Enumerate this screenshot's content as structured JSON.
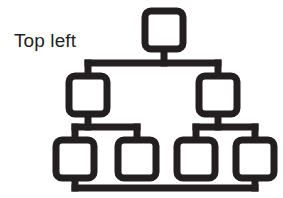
{
  "canvas": {
    "width": 283,
    "height": 198,
    "background_color": "#ffffff"
  },
  "label": {
    "text": "Top left",
    "color": "#231f20",
    "x": 14,
    "y": 30,
    "font_size": 19
  },
  "diagram": {
    "name": "hierarchy-tree-icon",
    "stroke_color": "#231f20",
    "fill_color": "#ffffff",
    "stroke_width": 7,
    "corner_radius": 6,
    "nodes": [
      {
        "id": "root",
        "level": 0,
        "x": 145,
        "y": 11,
        "w": 38,
        "h": 38,
        "label": ""
      },
      {
        "id": "mid-1",
        "level": 1,
        "x": 69,
        "y": 76,
        "w": 38,
        "h": 38,
        "label": ""
      },
      {
        "id": "mid-2",
        "level": 1,
        "x": 199,
        "y": 76,
        "w": 38,
        "h": 38,
        "label": ""
      },
      {
        "id": "leaf-1",
        "level": 2,
        "x": 56,
        "y": 140,
        "w": 38,
        "h": 38,
        "label": ""
      },
      {
        "id": "leaf-2",
        "level": 2,
        "x": 118,
        "y": 140,
        "w": 38,
        "h": 38,
        "label": ""
      },
      {
        "id": "leaf-3",
        "level": 2,
        "x": 177,
        "y": 140,
        "w": 38,
        "h": 38,
        "label": ""
      },
      {
        "id": "leaf-4",
        "level": 2,
        "x": 236,
        "y": 140,
        "w": 38,
        "h": 38,
        "label": ""
      }
    ],
    "connectors": [
      {
        "id": "root-stem",
        "type": "vertical",
        "x": 164,
        "y1": 49,
        "y2": 63
      },
      {
        "id": "level1-bus",
        "type": "horizontal",
        "y": 63,
        "x1": 88,
        "x2": 218
      },
      {
        "id": "mid1-stem",
        "type": "vertical",
        "x": 88,
        "y1": 63,
        "y2": 76
      },
      {
        "id": "mid2-stem",
        "type": "vertical",
        "x": 218,
        "y1": 63,
        "y2": 76
      },
      {
        "id": "mid1-down-stem",
        "type": "vertical",
        "x": 88,
        "y1": 114,
        "y2": 127
      },
      {
        "id": "left-leaf-bus",
        "type": "horizontal",
        "y": 127,
        "x1": 75,
        "x2": 137
      },
      {
        "id": "leaf1-stem",
        "type": "vertical",
        "x": 75,
        "y1": 127,
        "y2": 140
      },
      {
        "id": "leaf2-stem",
        "type": "vertical",
        "x": 137,
        "y1": 127,
        "y2": 140
      },
      {
        "id": "mid2-down-stem",
        "type": "vertical",
        "x": 218,
        "y1": 114,
        "y2": 127
      },
      {
        "id": "right-leaf-bus",
        "type": "horizontal",
        "y": 127,
        "x1": 196,
        "x2": 255
      },
      {
        "id": "leaf3-stem",
        "type": "vertical",
        "x": 196,
        "y1": 127,
        "y2": 140
      },
      {
        "id": "leaf4-stem",
        "type": "vertical",
        "x": 255,
        "y1": 127,
        "y2": 140
      },
      {
        "id": "leaf1-bottom-stem",
        "type": "vertical",
        "x": 75,
        "y1": 178,
        "y2": 188
      },
      {
        "id": "bottom-bus",
        "type": "horizontal",
        "y": 188,
        "x1": 75,
        "x2": 255
      },
      {
        "id": "leaf4-bottom-stem",
        "type": "vertical",
        "x": 255,
        "y1": 178,
        "y2": 188
      }
    ]
  }
}
